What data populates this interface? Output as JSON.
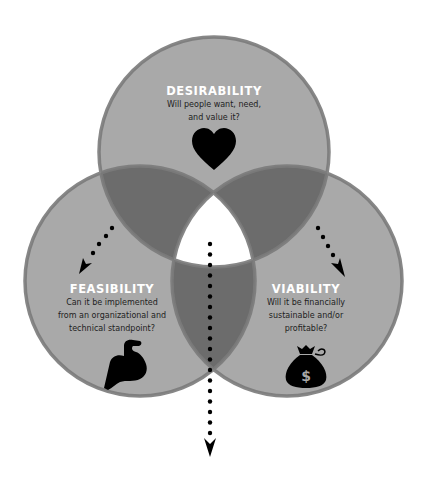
{
  "diagram": {
    "type": "venn",
    "colors": {
      "circle_fill": "#a9a9a9",
      "circle_border": "#7b7b7b",
      "overlap_fill": "#6c6c6c",
      "center_fill": "#ffffff",
      "title_text": "#ffffff",
      "question_text": "#222222",
      "icon": "#000000",
      "arrow": "#000000"
    },
    "circles": [
      {
        "id": "desirability",
        "title": "DESIRABILITY",
        "question": "Will people want, need,\nand value it?",
        "icon": "heart-icon"
      },
      {
        "id": "feasibility",
        "title": "FEASIBILITY",
        "question": "Can it be implemented\nfrom an organizational and\ntechnical standpoint?",
        "icon": "flexed-bicep-icon"
      },
      {
        "id": "viability",
        "title": "VIABILITY",
        "question": "Will it be financially\nsustainable and/or\nprofitable?",
        "icon": "money-bag-icon",
        "icon_symbol": "$"
      }
    ],
    "arrows": [
      {
        "id": "arrow-to-feasibility",
        "style": "dotted",
        "direction": "down-left"
      },
      {
        "id": "arrow-to-viability",
        "style": "dotted",
        "direction": "down-right"
      },
      {
        "id": "arrow-center-down",
        "style": "dotted",
        "direction": "down"
      }
    ]
  }
}
